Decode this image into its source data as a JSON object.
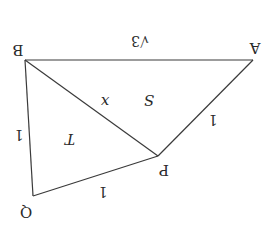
{
  "diagram": {
    "rotation_deg": 180,
    "stroke_color": "#3a3a3a",
    "text_color": "#2a2a2a",
    "points": {
      "A": {
        "label": "A",
        "x": 253,
        "y": 60
      },
      "B": {
        "label": "B",
        "x": 25,
        "y": 60
      },
      "P": {
        "label": "P",
        "x": 158,
        "y": 156
      },
      "Q": {
        "label": "Q",
        "x": 33,
        "y": 196
      }
    },
    "segments": [
      {
        "from": "A",
        "to": "B",
        "label": "√3"
      },
      {
        "from": "B",
        "to": "P",
        "label": "x"
      },
      {
        "from": "A",
        "to": "P",
        "label": "1"
      },
      {
        "from": "B",
        "to": "Q",
        "label": "1"
      },
      {
        "from": "P",
        "to": "Q",
        "label": "1"
      }
    ],
    "regions": [
      {
        "name": "triangle-ABP",
        "label": "S"
      },
      {
        "name": "triangle-BPQ",
        "label": "T"
      }
    ]
  }
}
